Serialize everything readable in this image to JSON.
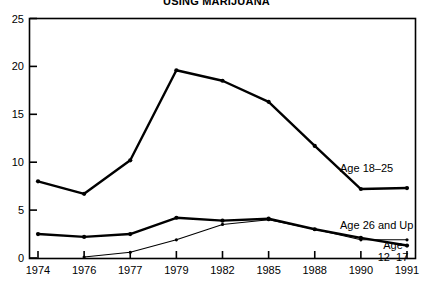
{
  "chart_data": {
    "type": "line",
    "title": "USING MARIJUANA",
    "xlabel": "",
    "ylabel": "",
    "x": [
      "1974",
      "1976",
      "1977",
      "1979",
      "1982",
      "1985",
      "1988",
      "1990",
      "1991"
    ],
    "categories": [
      "1974",
      "1976",
      "1977",
      "1979",
      "1982",
      "1985",
      "1988",
      "1990",
      "1991"
    ],
    "ylim": [
      0,
      25
    ],
    "yticks": [
      0,
      5,
      10,
      15,
      20,
      25
    ],
    "ytick_labels": [
      "0",
      "5",
      "10",
      "15",
      "20",
      "25"
    ],
    "grid": false,
    "legend_position": "right-inline",
    "series": [
      {
        "name": "Age 18-25",
        "label": "Age 18–25",
        "values": [
          8.0,
          6.7,
          10.2,
          19.6,
          18.5,
          16.3,
          11.7,
          7.2,
          7.3
        ],
        "style": "thick",
        "markers": true
      },
      {
        "name": "Age 26 and Up",
        "label": "Age 26 and Up",
        "values": [
          null,
          0.1,
          0.6,
          1.9,
          3.5,
          4.0,
          3.0,
          1.9,
          1.9
        ],
        "style": "thin",
        "markers": true
      },
      {
        "name": "Age 12-17",
        "label": "Age\n12–17",
        "label_line1": "Age",
        "label_line2": "12–17",
        "values": [
          2.5,
          2.2,
          2.5,
          4.2,
          3.9,
          4.1,
          3.0,
          2.1,
          1.3
        ],
        "style": "thick",
        "markers": true
      }
    ],
    "annotations": [
      {
        "text": "Age 18–25",
        "series": "Age 18-25"
      },
      {
        "text": "Age 26 and Up",
        "series": "Age 26 and Up"
      },
      {
        "text": "Age 12–17",
        "series": "Age 12-17"
      }
    ],
    "colors": {
      "line": "#000000",
      "axis": "#000000",
      "background": "#ffffff"
    }
  },
  "chart": {
    "title": "USING MARIJUANA"
  }
}
